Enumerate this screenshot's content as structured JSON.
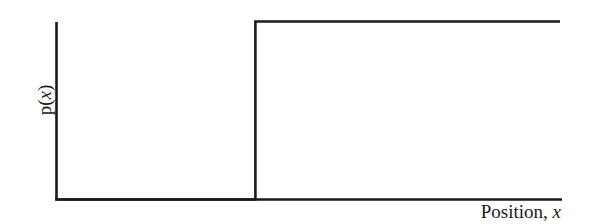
{
  "chart_data": {
    "type": "line",
    "title": "",
    "xlabel": "Position, x",
    "ylabel": "p(x)",
    "x": [
      0,
      0.395,
      0.395,
      1.0
    ],
    "values": [
      0,
      0,
      1,
      1
    ],
    "series": [
      {
        "name": "p(x)",
        "points": [
          [
            0,
            0
          ],
          [
            0.395,
            0
          ],
          [
            0.395,
            1
          ],
          [
            1.0,
            1
          ]
        ]
      }
    ],
    "xlim": [
      0,
      1
    ],
    "ylim": [
      0,
      1
    ],
    "grid": false,
    "ticks": false,
    "legend": null
  },
  "labels": {
    "y_prefix": "p(",
    "y_var": "x",
    "y_suffix": ")",
    "x_text": "Position, ",
    "x_var": "x"
  },
  "colors": {
    "line": "#1a1a1a",
    "background": "#ffffff"
  }
}
